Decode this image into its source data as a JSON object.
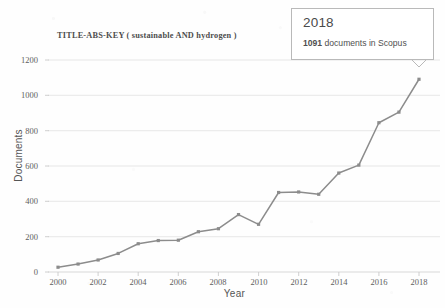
{
  "chart_data": {
    "type": "line",
    "title": "TITLE-ABS-KEY ( sustainable  AND hydrogen )",
    "xlabel": "Year",
    "ylabel": "Documents",
    "xlim": [
      2000,
      2018
    ],
    "ylim": [
      0,
      1200
    ],
    "grid": true,
    "legend": "none",
    "series_color": "#8c8c8c",
    "categories": [
      2000,
      2001,
      2002,
      2003,
      2004,
      2005,
      2006,
      2007,
      2008,
      2009,
      2010,
      2011,
      2012,
      2013,
      2014,
      2015,
      2016,
      2017,
      2018
    ],
    "values": [
      27,
      45,
      68,
      105,
      160,
      178,
      180,
      228,
      245,
      325,
      270,
      450,
      453,
      440,
      560,
      605,
      845,
      905,
      1091
    ],
    "x_ticks": [
      "2000",
      "2002",
      "2004",
      "2006",
      "2008",
      "2010",
      "2012",
      "2014",
      "2016",
      "2018"
    ],
    "x_tick_values": [
      2000,
      2002,
      2004,
      2006,
      2008,
      2010,
      2012,
      2014,
      2016,
      2018
    ],
    "y_ticks": [
      "0",
      "200",
      "400",
      "600",
      "800",
      "1000",
      "1200"
    ],
    "y_tick_values": [
      0,
      200,
      400,
      600,
      800,
      1000,
      1200
    ],
    "annotations": [
      {
        "name": "callout-2018",
        "year": "2018",
        "detail_count": "1091",
        "detail_text": " documents in Scopus",
        "points_to_x": 2018,
        "points_to_y": 1091
      }
    ]
  }
}
